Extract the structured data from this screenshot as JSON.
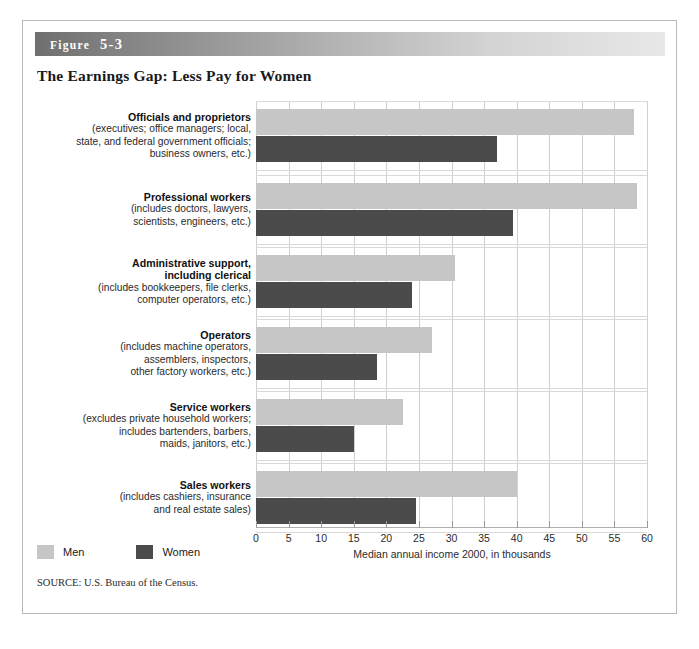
{
  "figure": {
    "banner_label_word": "Figure",
    "banner_number": "5-3",
    "title": "The Earnings Gap: Less Pay for Women",
    "source": "SOURCE: U.S. Bureau of the Census."
  },
  "legend": {
    "items": [
      {
        "label": "Men",
        "color": "#c6c6c6",
        "swatch_name": "legend-swatch-men"
      },
      {
        "label": "Women",
        "color": "#4b4b4b",
        "swatch_name": "legend-swatch-women"
      }
    ]
  },
  "chart_data": {
    "type": "bar",
    "orientation": "horizontal",
    "title": "The Earnings Gap: Less Pay for Women",
    "xlabel": "Median annual income 2000, in thousands",
    "ylabel": "",
    "xlim": [
      0,
      60
    ],
    "xticks": [
      0,
      5,
      10,
      15,
      20,
      25,
      30,
      35,
      40,
      45,
      50,
      55,
      60
    ],
    "xtick_labels": [
      "0",
      "5",
      "10",
      "15",
      "20",
      "25",
      "30",
      "35",
      "40",
      "45",
      "50",
      "55",
      "60"
    ],
    "grid": true,
    "legend_position": "bottom-left",
    "categories": [
      "Officials and proprietors",
      "Professional workers",
      "Administrative support, including clerical",
      "Operators",
      "Service workers",
      "Sales workers"
    ],
    "category_labels": [
      {
        "title_lines": [
          "Officials and proprietors"
        ],
        "sub_lines": [
          "(executives; office managers; local,",
          "state, and federal government officials;",
          "business owners, etc.)"
        ]
      },
      {
        "title_lines": [
          "Professional workers"
        ],
        "sub_lines": [
          "(includes doctors, lawyers,",
          "scientists, engineers, etc.)"
        ]
      },
      {
        "title_lines": [
          "Administrative support,",
          "including clerical"
        ],
        "sub_lines": [
          "(includes bookkeepers, file clerks,",
          "computer operators, etc.)"
        ]
      },
      {
        "title_lines": [
          "Operators"
        ],
        "sub_lines": [
          "(includes machine operators,",
          "assemblers, inspectors,",
          "other factory workers, etc.)"
        ]
      },
      {
        "title_lines": [
          "Service workers"
        ],
        "sub_lines": [
          "(excludes private household workers;",
          "includes bartenders, barbers,",
          "maids, janitors, etc.)"
        ]
      },
      {
        "title_lines": [
          "Sales workers"
        ],
        "sub_lines": [
          "(includes cashiers, insurance",
          "and real estate sales)"
        ]
      }
    ],
    "series": [
      {
        "name": "Men",
        "color": "#c6c6c6",
        "values": [
          58,
          58.5,
          30.5,
          27,
          22.5,
          40
        ]
      },
      {
        "name": "Women",
        "color": "#4b4b4b",
        "values": [
          37,
          39.5,
          24,
          18.5,
          15,
          24.5
        ]
      }
    ]
  }
}
